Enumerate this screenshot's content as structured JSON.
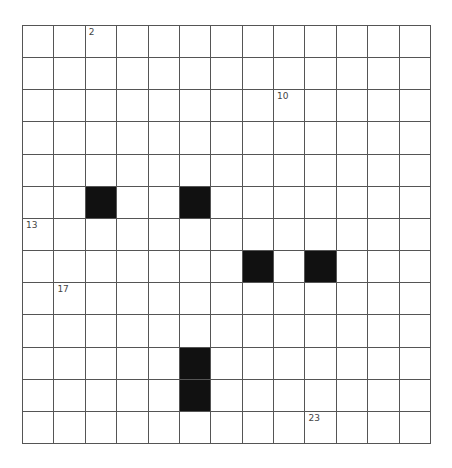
{
  "crossword": {
    "rows": 13,
    "cols": 13,
    "colors": {
      "block": "#111111",
      "cell": "#ffffff",
      "line": "#555555",
      "number": "#444444"
    },
    "blocks": [
      [
        5,
        2
      ],
      [
        5,
        5
      ],
      [
        7,
        7
      ],
      [
        7,
        9
      ],
      [
        10,
        5
      ],
      [
        11,
        5
      ]
    ],
    "numbers": [
      {
        "row": 0,
        "col": 2,
        "label": "2"
      },
      {
        "row": 2,
        "col": 8,
        "label": "10"
      },
      {
        "row": 6,
        "col": 0,
        "label": "13"
      },
      {
        "row": 8,
        "col": 1,
        "label": "17"
      },
      {
        "row": 12,
        "col": 9,
        "label": "23"
      }
    ]
  }
}
